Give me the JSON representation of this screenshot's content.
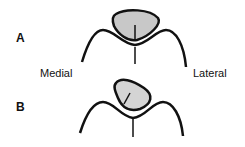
{
  "figure": {
    "panels": [
      {
        "letter": "A",
        "description": "patella centered in trochlear groove"
      },
      {
        "letter": "B",
        "description": "patella tilted/displaced laterally"
      }
    ],
    "labels": {
      "medial": "Medial",
      "lateral": "Lateral"
    },
    "colors": {
      "stroke": "#111111",
      "patella_fill": "#c8c8c8",
      "background": "#ffffff"
    }
  }
}
